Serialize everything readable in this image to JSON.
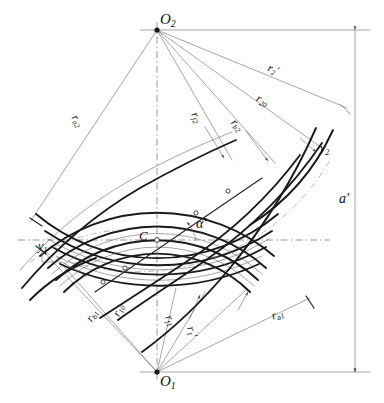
{
  "figure": {
    "type": "engineering-line-diagram",
    "background_color": "#ffffff",
    "line_color": "#1a1a1a",
    "width": 384,
    "height": 403
  },
  "apexes": {
    "top": {
      "name": "O2",
      "letter": "O",
      "sub": "2",
      "x": 157,
      "y": 30
    },
    "bottom": {
      "name": "O1",
      "letter": "O",
      "sub": "1",
      "x": 157,
      "y": 372
    }
  },
  "pitch_point": {
    "name": "C",
    "letter": "C",
    "x": 157,
    "y": 240
  },
  "angle": {
    "label_letter": "α",
    "label_prime": "′",
    "name": "pressure-angle"
  },
  "dimension": {
    "label_letter": "a",
    "label_prime": "′",
    "name": "center-distance",
    "x": 355
  },
  "offsets": [
    {
      "name": "y1",
      "letter": "y",
      "sub": "1"
    },
    {
      "name": "y2",
      "letter": "y",
      "sub": "2"
    }
  ],
  "radii_top": [
    {
      "name": "r-a2",
      "letter": "r",
      "sub": "a2",
      "prime": "",
      "desc": "addendum radius gear 2"
    },
    {
      "name": "r-f2",
      "letter": "r",
      "sub": "f2",
      "prime": "",
      "desc": "dedendum radius gear 2"
    },
    {
      "name": "r-b2",
      "letter": "r",
      "sub": "b2",
      "prime": "",
      "desc": "base radius gear 2"
    },
    {
      "name": "r-20",
      "letter": "r",
      "sub": "20",
      "prime": "",
      "desc": "reference radius gear 2"
    },
    {
      "name": "r-2-prime",
      "letter": "r",
      "sub": "2",
      "prime": "′",
      "desc": "operating pitch radius gear 2"
    }
  ],
  "radii_bottom": [
    {
      "name": "r-b1",
      "letter": "r",
      "sub": "b1",
      "prime": "",
      "desc": "base radius gear 1"
    },
    {
      "name": "r-10",
      "letter": "r",
      "sub": "10",
      "prime": "",
      "desc": "reference radius gear 1"
    },
    {
      "name": "r-f1",
      "letter": "r",
      "sub": "f1",
      "prime": "",
      "desc": "dedendum radius gear 1"
    },
    {
      "name": "r-1-prime",
      "letter": "r",
      "sub": "1",
      "prime": "′",
      "desc": "operating pitch radius gear 1"
    },
    {
      "name": "r-a1",
      "letter": "r",
      "sub": "a1",
      "prime": "",
      "desc": "addendum radius gear 1"
    }
  ]
}
